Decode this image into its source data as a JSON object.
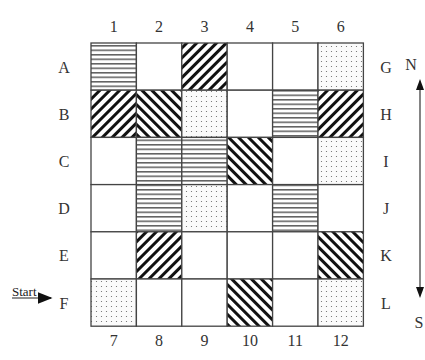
{
  "diagram": {
    "type": "grid-map",
    "rows": 6,
    "cols": 6,
    "column_labels_top": [
      "1",
      "2",
      "3",
      "4",
      "5",
      "6"
    ],
    "column_labels_bottom": [
      "7",
      "8",
      "9",
      "10",
      "11",
      "12"
    ],
    "row_labels_left": [
      "A",
      "B",
      "C",
      "D",
      "E",
      "F"
    ],
    "row_labels_right": [
      "G",
      "H",
      "I",
      "J",
      "K",
      "L"
    ],
    "legend_patterns": {
      "H": "horizontal-lines",
      "B": "backslash-diagonal",
      "F": "forward-slash-diagonal",
      "D": "dotted",
      "W": "blank"
    },
    "cells": [
      [
        "H",
        "W",
        "B",
        "W",
        "W",
        "D"
      ],
      [
        "B",
        "F",
        "D",
        "W",
        "H",
        "B"
      ],
      [
        "W",
        "H",
        "H",
        "F",
        "W",
        "D"
      ],
      [
        "W",
        "H",
        "D",
        "W",
        "H",
        "W"
      ],
      [
        "W",
        "B",
        "W",
        "W",
        "W",
        "F"
      ],
      [
        "D",
        "W",
        "W",
        "F",
        "W",
        "D"
      ]
    ],
    "start": {
      "label": "Start",
      "row": "F",
      "arrow": "right"
    },
    "compass": {
      "north": "N",
      "south": "S"
    }
  }
}
